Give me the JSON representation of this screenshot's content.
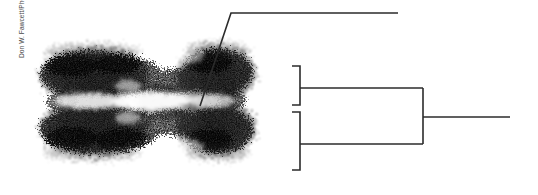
{
  "figure": {
    "background_color": "#ffffff",
    "width": 538,
    "height": 195
  },
  "credit": {
    "text": "Don W. Fawcett/Photo Researchers/Getty Images",
    "orientation": "vertical-bottom-to-top",
    "color": "#4a4a4a"
  },
  "micrograph": {
    "alt": "Electron micrograph of a duplicated metaphase chromosome showing two sister chromatids joined at the centromere",
    "stain_color": "#141414",
    "background_color": "#ffffff"
  },
  "annotations": {
    "line_color": "#2b2b2b",
    "leader": {
      "name": "centromere-leader-line",
      "points": "200,106 231,13 398,13"
    },
    "brackets": [
      {
        "name": "upper-chromatid-bracket",
        "top": 66,
        "bottom": 105,
        "spine_x": 300,
        "arm_x": 292,
        "stem_y": 88,
        "stem_to_x": 423
      },
      {
        "name": "lower-chromatid-bracket",
        "top": 112,
        "bottom": 170,
        "spine_x": 300,
        "arm_x": 292,
        "stem_y": 144,
        "stem_to_x": 423
      },
      {
        "name": "whole-chromosome-bracket",
        "top": 88,
        "bottom": 144,
        "spine_x": 423,
        "stem_y": 117,
        "stem_to_x": 510
      }
    ]
  }
}
